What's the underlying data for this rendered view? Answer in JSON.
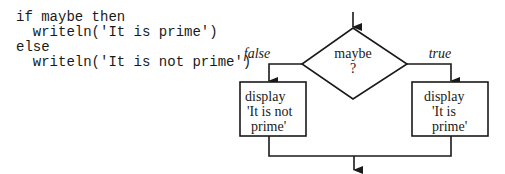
{
  "code": {
    "lines": [
      "if maybe then",
      "  writeln('It is prime')",
      "else",
      "  writeln('It is not prime')"
    ]
  },
  "flowchart": {
    "decision": {
      "line1": "maybe",
      "line2": "?"
    },
    "branch_false": {
      "label": "false"
    },
    "branch_true": {
      "label": "true"
    },
    "box_false": {
      "line1": "display",
      "line2": "'It is not",
      "line3": "prime'"
    },
    "box_true": {
      "line1": "display",
      "line2": "'It is",
      "line3": "prime'"
    }
  }
}
